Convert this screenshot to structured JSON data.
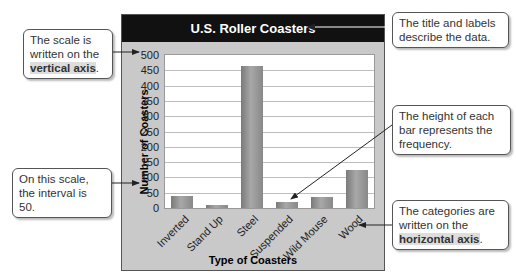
{
  "chart_data": {
    "type": "bar",
    "title": "U.S. Roller Coasters",
    "xlabel": "Type of Coasters",
    "ylabel": "Number of Coasters",
    "categories": [
      "Inverted",
      "Stand Up",
      "Steel",
      "Suspended",
      "Wild Mouse",
      "Wood"
    ],
    "values": [
      40,
      10,
      463,
      20,
      35,
      125
    ],
    "ylim": [
      0,
      500
    ],
    "yticks": [
      0,
      50,
      100,
      150,
      200,
      250,
      300,
      350,
      400,
      450,
      500
    ],
    "grid": true,
    "legend": null
  },
  "callouts": {
    "scale": {
      "pre": "The scale is written on the ",
      "bold": "vertical axis",
      "post": "."
    },
    "title": {
      "text": "The title and labels describe the data."
    },
    "height": {
      "text": "The height of each bar represents the frequency."
    },
    "interval": {
      "text": "On this scale, the interval is 50."
    },
    "categories": {
      "pre": "The categories are written on the ",
      "bold": "horizontal axis",
      "post": "."
    }
  },
  "colors": {
    "title_bg": "#111111",
    "frame_bg": "#c9c9c9",
    "bar": "#8e8e8e"
  }
}
